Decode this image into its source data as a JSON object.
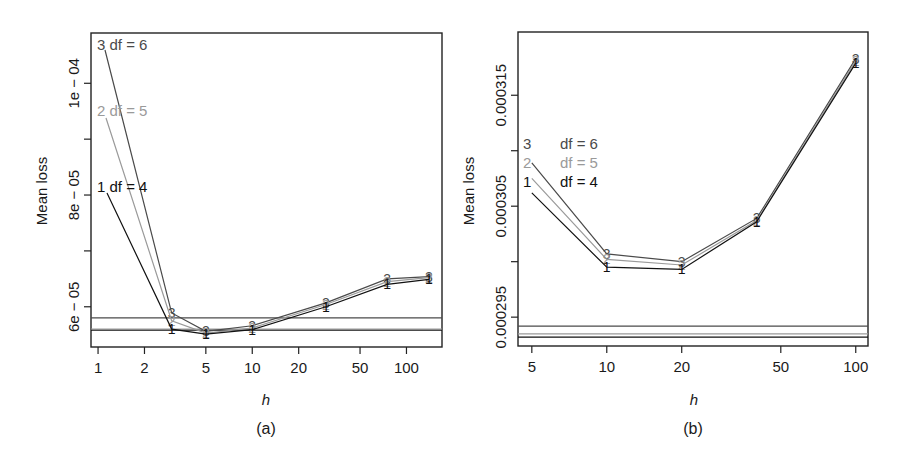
{
  "figure": {
    "panels": [
      {
        "caption": "(a)",
        "xlabel": "h",
        "ylabel": "Mean loss"
      },
      {
        "caption": "(b)",
        "xlabel": "h",
        "ylabel": "Mean loss"
      }
    ]
  },
  "colors": {
    "df6": "#4a4a4a",
    "df5": "#9a9a9a",
    "df4": "#111111",
    "axis": "#222222"
  },
  "chart_data": [
    {
      "type": "line",
      "title": "",
      "caption": "(a)",
      "xlabel": "h",
      "ylabel": "Mean loss",
      "x_scale": "log",
      "xlim": [
        0.9,
        170
      ],
      "ylim": [
        5.28e-05,
        0.000109
      ],
      "x_ticks": [
        1,
        2,
        5,
        10,
        20,
        50,
        100
      ],
      "x_tick_labels": [
        "1",
        "2",
        "5",
        "10",
        "20",
        "50",
        "100"
      ],
      "y_ticks": [
        6e-05,
        7e-05,
        8e-05,
        9e-05,
        0.0001
      ],
      "y_tick_labels": [
        "6e − 05",
        "",
        "8e − 05",
        "",
        "1e − 04"
      ],
      "grid": false,
      "legend_position": "inline-left",
      "x": [
        1,
        3,
        5,
        10,
        30,
        75,
        140
      ],
      "series": [
        {
          "name": "df = 6",
          "marker": "3",
          "color_key": "df6",
          "values": [
            0.0001065,
            5.89e-05,
            5.56e-05,
            5.66e-05,
            6.07e-05,
            6.5e-05,
            6.54e-05
          ],
          "baseline": 5.8e-05
        },
        {
          "name": "df = 5",
          "marker": "2",
          "color_key": "df5",
          "values": [
            9.42e-05,
            5.75e-05,
            5.53e-05,
            5.62e-05,
            6.04e-05,
            6.45e-05,
            6.52e-05
          ],
          "baseline": 5.6e-05
        },
        {
          "name": "df = 4",
          "marker": "1",
          "color_key": "df4",
          "values": [
            8.07e-05,
            5.6e-05,
            5.51e-05,
            5.59e-05,
            6e-05,
            6.4e-05,
            6.49e-05
          ],
          "baseline": 5.58e-05
        }
      ],
      "legend": [
        {
          "marker": "3",
          "label": "df = 6"
        },
        {
          "marker": "2",
          "label": "df = 5"
        },
        {
          "marker": "1",
          "label": "df = 4"
        }
      ]
    },
    {
      "type": "line",
      "title": "",
      "caption": "(b)",
      "xlabel": "h",
      "ylabel": "Mean loss",
      "x_scale": "log",
      "xlim": [
        4.4,
        112
      ],
      "ylim": [
        0.0002924,
        0.0003207
      ],
      "x_ticks": [
        5,
        10,
        20,
        50,
        100
      ],
      "x_tick_labels": [
        "5",
        "10",
        "20",
        "50",
        "100"
      ],
      "y_ticks": [
        0.000295,
        0.0003,
        0.000305,
        0.00031,
        0.000315
      ],
      "y_tick_labels": [
        "0.000295",
        "",
        "0.000305",
        "",
        "0.000315"
      ],
      "grid": false,
      "legend_position": "upper-left",
      "x": [
        5,
        10,
        20,
        40,
        100
      ],
      "series": [
        {
          "name": "df = 6",
          "marker": "3",
          "color_key": "df6",
          "values": [
            0.0003089,
            0.0003007,
            0.0003,
            0.0003039,
            0.0003183
          ],
          "baseline": 0.0002942
        },
        {
          "name": "df = 5",
          "marker": "2",
          "color_key": "df5",
          "values": [
            0.0003075,
            0.0003002,
            0.0002997,
            0.0003037,
            0.0003181
          ],
          "baseline": 0.0002935
        },
        {
          "name": "df = 4",
          "marker": "1",
          "color_key": "df4",
          "values": [
            0.0003062,
            0.0002995,
            0.0002993,
            0.0003036,
            0.0003179
          ],
          "baseline": 0.0002932
        }
      ],
      "legend": [
        {
          "marker": "3",
          "label": "df = 6"
        },
        {
          "marker": "2",
          "label": "df = 5"
        },
        {
          "marker": "1",
          "label": "df = 4"
        }
      ]
    }
  ]
}
